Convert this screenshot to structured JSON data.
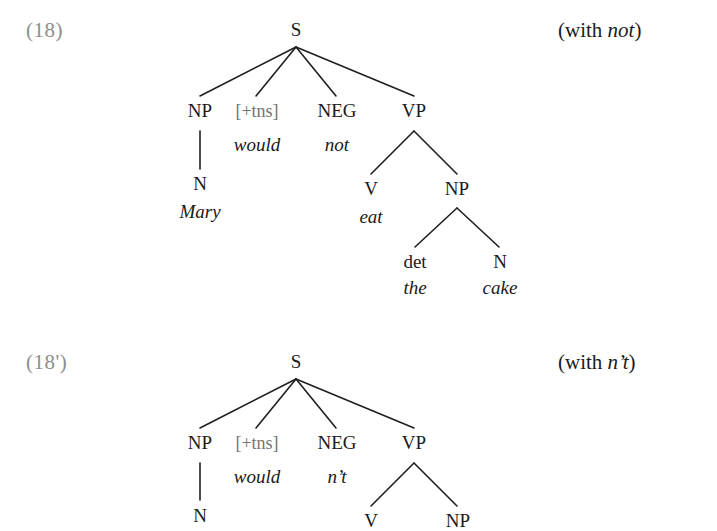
{
  "page": {
    "background": "#ffffff",
    "text_color": "#1a1a1a",
    "muted_color": "#8d8d8d",
    "feature_color": "#737373",
    "width": 717,
    "height": 513
  },
  "figures": [
    {
      "id": "example-18",
      "number": "(18)",
      "gloss_prefix": "(with ",
      "gloss_italic": "not",
      "gloss_suffix": ")",
      "root": "S",
      "nodes": {
        "s": "S",
        "np_subject": "NP",
        "tns": "[+tns]",
        "neg": "NEG",
        "vp": "VP",
        "n_subject": "N",
        "v": "V",
        "np_object": "NP",
        "det": "det",
        "n_object": "N"
      },
      "words": {
        "would": "would",
        "not": "not",
        "mary": "Mary",
        "eat": "eat",
        "the": "the",
        "cake": "cake"
      }
    },
    {
      "id": "example-18-prime",
      "number": "(18')",
      "gloss_prefix": "(with ",
      "gloss_italic": "n’t",
      "gloss_suffix": ")",
      "root": "S",
      "nodes": {
        "s": "S",
        "np_subject": "NP",
        "tns": "[+tns]",
        "neg": "NEG",
        "vp": "VP",
        "n_subject": "N",
        "v": "V",
        "np_object": "NP"
      },
      "words": {
        "would": "would",
        "nt": "n’t"
      }
    }
  ]
}
